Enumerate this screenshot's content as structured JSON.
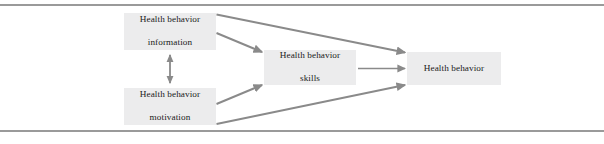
{
  "figure": {
    "name": "imb-model-diagram",
    "colors": {
      "node_fill": "#ececed",
      "node_text": "#1b1b1b",
      "arrow": "#8a8a8a",
      "rule": "#9a9a9a",
      "background": "#ffffff"
    }
  },
  "nodes": {
    "information": {
      "line1": "Health behavior",
      "line2": "information"
    },
    "motivation": {
      "line1": "Health behavior",
      "line2": "motivation"
    },
    "skills": {
      "line1": "Health behavior",
      "line2": "skills"
    },
    "behavior": {
      "line1": "Health behavior",
      "line2": ""
    }
  },
  "edges": [
    {
      "id": "information-to-behavior",
      "from": "information",
      "to": "behavior",
      "style": "single-arrow",
      "label": ""
    },
    {
      "id": "information-to-skills",
      "from": "information",
      "to": "skills",
      "style": "single-arrow",
      "label": ""
    },
    {
      "id": "information-motivation",
      "from": "information",
      "to": "motivation",
      "style": "double-arrow",
      "label": ""
    },
    {
      "id": "motivation-to-skills",
      "from": "motivation",
      "to": "skills",
      "style": "single-arrow",
      "label": ""
    },
    {
      "id": "motivation-to-behavior",
      "from": "motivation",
      "to": "behavior",
      "style": "single-arrow",
      "label": ""
    },
    {
      "id": "skills-to-behavior",
      "from": "skills",
      "to": "behavior",
      "style": "single-arrow",
      "label": ""
    }
  ],
  "rules": {
    "top": "horizontal-rule",
    "bottom": "horizontal-rule"
  }
}
